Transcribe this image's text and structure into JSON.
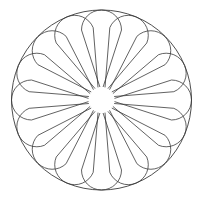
{
  "figure": {
    "petal_count": 16,
    "stroke_color": "#3a3a3a",
    "background": "#ffffff",
    "center": [
      101.5,
      100
    ],
    "outer_radius": 90,
    "petal_cap_radius": 20,
    "petal_inner_radius": 13,
    "petal_inner_halfwidth": 1.6
  }
}
